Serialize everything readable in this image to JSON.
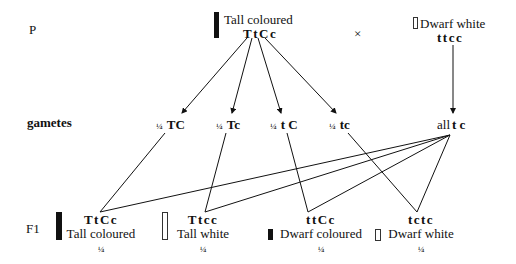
{
  "rows": {
    "parent_label": "P",
    "gametes_label": "gametes",
    "f1_label": "F1"
  },
  "parents": {
    "left": {
      "phenotype": "Tall coloured",
      "genotype": "TtCc",
      "symbol": "filled-bar-tall"
    },
    "cross_symbol": "×",
    "right": {
      "phenotype": "Dwarf white",
      "genotype": "ttcc",
      "symbol": "empty-bar-short"
    }
  },
  "gametes": {
    "left": [
      {
        "fraction": "¼",
        "allele": "TC"
      },
      {
        "fraction": "¼",
        "allele": "Tc"
      },
      {
        "fraction": "¼",
        "allele": "t C"
      },
      {
        "fraction": "¼",
        "allele": "tc"
      }
    ],
    "right": {
      "prefix": "all",
      "allele": "t c"
    }
  },
  "f1": [
    {
      "genotype": "TtCc",
      "phenotype": "Tall coloured",
      "fraction": "¼",
      "symbol": "filled-bar-tall"
    },
    {
      "genotype": "Ttcc",
      "phenotype": "Tall white",
      "fraction": "¼",
      "symbol": "empty-bar-tall"
    },
    {
      "genotype": "ttCc",
      "phenotype": "Dwarf coloured",
      "fraction": "¼",
      "symbol": "filled-bar-short"
    },
    {
      "genotype": "tctc",
      "phenotype": "Dwarf white",
      "fraction": "¼",
      "symbol": "empty-bar-short"
    }
  ],
  "colors": {
    "ink": "#111111",
    "background": "#ffffff"
  }
}
